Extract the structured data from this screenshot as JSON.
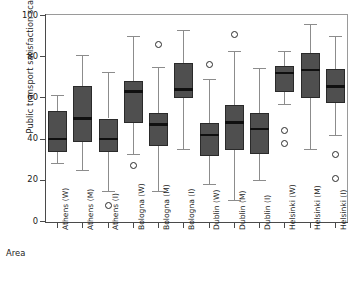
{
  "chart_data": {
    "type": "box",
    "title": "",
    "xlabel": "Area",
    "ylabel": "Public transport satisfaction scale",
    "ylim": [
      0,
      100
    ],
    "yticks": [
      0,
      20,
      40,
      60,
      80,
      100
    ],
    "grid": false,
    "legend": "none",
    "categories": [
      "Athens (W)",
      "Athens (M)",
      "Athens (I)",
      "Bologna (W)",
      "Bologna (M)",
      "Bologna (I)",
      "Dublin (W)",
      "Dublin (M)",
      "Dublin (I)",
      "Helsinki (W)",
      "Helsinki (M)",
      "Helsinki (I)"
    ],
    "boxes": [
      {
        "category": "Athens (W)",
        "whisker_low": 28.5,
        "q1": 33.5,
        "median": 40.0,
        "q3": 53.5,
        "whisker_high": 61.5,
        "outliers": []
      },
      {
        "category": "Athens (M)",
        "whisker_low": 25.0,
        "q1": 38.5,
        "median": 50.0,
        "q3": 66.0,
        "whisker_high": 81.0,
        "outliers": []
      },
      {
        "category": "Athens (I)",
        "whisker_low": 15.0,
        "q1": 33.5,
        "median": 40.0,
        "q3": 50.0,
        "whisker_high": 72.5,
        "outliers": [
          8.0
        ]
      },
      {
        "category": "Bologna (W)",
        "whisker_low": 33.0,
        "q1": 48.0,
        "median": 63.0,
        "q3": 68.0,
        "whisker_high": 90.0,
        "outliers": [
          27.0
        ]
      },
      {
        "category": "Bologna (M)",
        "whisker_low": 15.0,
        "q1": 36.5,
        "median": 47.0,
        "q3": 52.5,
        "whisker_high": 75.0,
        "outliers": [
          86.0
        ]
      },
      {
        "category": "Bologna (I)",
        "whisker_low": 35.0,
        "q1": 60.0,
        "median": 64.0,
        "q3": 77.0,
        "whisker_high": 93.0,
        "outliers": []
      },
      {
        "category": "Dublin (W)",
        "whisker_low": 18.0,
        "q1": 32.0,
        "median": 42.0,
        "q3": 48.0,
        "whisker_high": 69.0,
        "outliers": [
          76.0
        ]
      },
      {
        "category": "Dublin (M)",
        "whisker_low": 10.5,
        "q1": 34.5,
        "median": 48.0,
        "q3": 56.5,
        "whisker_high": 83.0,
        "outliers": [
          91.0
        ]
      },
      {
        "category": "Dublin (I)",
        "whisker_low": 20.0,
        "q1": 33.0,
        "median": 45.0,
        "q3": 52.5,
        "whisker_high": 74.5,
        "outliers": []
      },
      {
        "category": "Helsinki (W)",
        "whisker_low": 57.0,
        "q1": 63.0,
        "median": 72.0,
        "q3": 75.5,
        "whisker_high": 83.0,
        "outliers": [
          44.0,
          38.0
        ]
      },
      {
        "category": "Helsinki (M)",
        "whisker_low": 35.0,
        "q1": 60.0,
        "median": 73.5,
        "q3": 82.0,
        "whisker_high": 96.0,
        "outliers": []
      },
      {
        "category": "Helsinki (I)",
        "whisker_low": 42.0,
        "q1": 57.5,
        "median": 65.5,
        "q3": 74.0,
        "whisker_high": 90.0,
        "outliers": [
          32.5,
          21.0
        ]
      }
    ]
  }
}
